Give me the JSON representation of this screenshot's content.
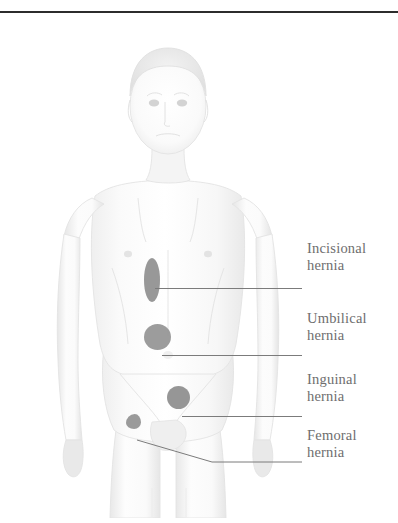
{
  "rule": {
    "color": "#2c2c2c"
  },
  "colors": {
    "marker": "#8e8e8e",
    "leader": "#7b7b7b",
    "label_text": "#6e6e6e",
    "body_fill": "#fbfbfb",
    "body_shade": "#ededed",
    "body_outline": "#e2e2e2"
  },
  "callouts": [
    {
      "id": "incisional",
      "line1": "Incisional",
      "line2": "hernia",
      "marker_shape": "vertical-ellipse",
      "marker_center": {
        "x": 152,
        "y": 280
      },
      "leader": {
        "type": "horizontal",
        "y": 270,
        "x_start": 155,
        "x_end": 300
      },
      "label_top": 240
    },
    {
      "id": "umbilical",
      "line1": "Umbilical",
      "line2": "hernia",
      "marker_shape": "circle",
      "marker_center": {
        "x": 158,
        "y": 337
      },
      "leader": {
        "type": "horizontal",
        "y": 337,
        "x_start": 162,
        "x_end": 300
      },
      "label_top": 310
    },
    {
      "id": "inguinal",
      "line1": "Inguinal",
      "line2": "hernia",
      "marker_shape": "circle",
      "marker_center": {
        "x": 178,
        "y": 397
      },
      "leader": {
        "type": "horizontal",
        "y": 398,
        "x_start": 182,
        "x_end": 300
      },
      "label_top": 371
    },
    {
      "id": "femoral",
      "line1": "Femoral",
      "line2": "hernia",
      "marker_shape": "small-irregular-blob",
      "marker_center": {
        "x": 133,
        "y": 421
      },
      "leader": {
        "type": "elbow",
        "x_start": 136,
        "y_start": 422,
        "x_bend": 212,
        "y_bend": 444,
        "x_end": 300
      },
      "label_top": 427
    }
  ]
}
